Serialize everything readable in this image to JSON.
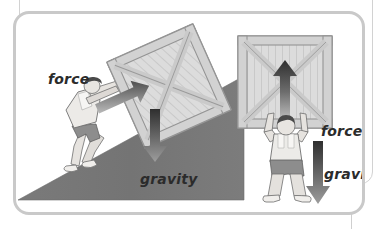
{
  "figure": {
    "background_color": "#ffffff",
    "frame_color": "#c9c9c9",
    "ramp_color": "#767676",
    "crate_color": "#d8d8d8",
    "crate_outline_color": "#9a9a9a",
    "arrow_dark": "#3a3a3a",
    "arrow_light": "#b8b8b8",
    "label_color": "#2b2b2b",
    "skin_color": "#e3e0dc",
    "shorts_color": "#8f8f8f",
    "hair_color": "#4a4a4a"
  },
  "scenes": [
    {
      "id": "incline-scene",
      "name": "person pushing crate up a ramp",
      "labels": {
        "force": "force",
        "gravity": "gravity"
      },
      "force_arrow_direction": "up-right",
      "gravity_arrow_direction": "down"
    },
    {
      "id": "lift-scene",
      "name": "person lifting crate overhead",
      "labels": {
        "force": "force",
        "gravity": "gravity"
      },
      "force_arrow_direction": "up",
      "gravity_arrow_direction": "down"
    }
  ],
  "labels": {
    "force_left": "force",
    "gravity_left": "gravity",
    "force_right": "force",
    "gravity_right": "gravity"
  }
}
